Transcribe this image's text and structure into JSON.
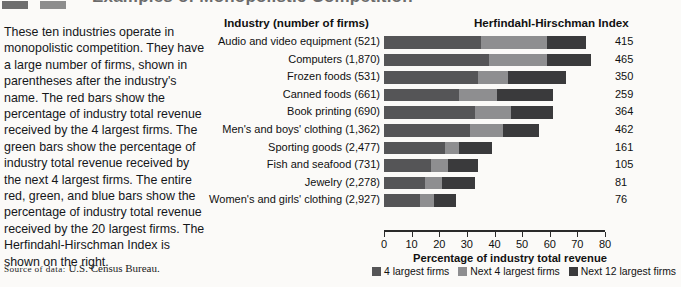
{
  "figure": {
    "cut_title": "Examples of Monopolistic Competition",
    "caption": "These ten industries operate in monopolistic competition. They have a large number of firms, shown in parentheses after the industry's name. The red bars show the percentage of industry total revenue received by the 4 largest firms. The green bars show the percentage of industry total revenue received by the next 4 largest firms. The entire red, green, and blue bars show the percentage of industry total revenue received by the 20 largest firms. The Herfindahl-Hirschman Index is shown on the right.",
    "source_label": "Source of data:",
    "source_value": "U.S. Census Bureau."
  },
  "chart_data": {
    "type": "bar",
    "subtype": "stacked-horizontal",
    "title": "Examples of Monopolistic Competition",
    "column_headers": {
      "industry": "Industry (number of firms)",
      "hhi": "Herfindahl-Hirschman Index"
    },
    "xlabel": "Percentage of industry total revenue",
    "ylabel": "",
    "xlim": [
      0,
      80
    ],
    "xticks": [
      0,
      10,
      20,
      30,
      40,
      50,
      60,
      70,
      80
    ],
    "xticklabels": [
      "0",
      "10",
      "20",
      "30",
      "40",
      "50",
      "60",
      "70",
      "80"
    ],
    "grid": false,
    "legend_position": "bottom-right",
    "categories": [
      "Audio and video equipment  (521)",
      "Computers  (1,870)",
      "Frozen foods  (531)",
      "Canned foods  (661)",
      "Book printing  (690)",
      "Men's and boys' clothing  (1,362)",
      "Sporting goods  (2,477)",
      "Fish and seafood  (731)",
      "Jewelry  (2,278)",
      "Women's and girls' clothing  (2,927)"
    ],
    "series": [
      {
        "name": "4 largest firms",
        "color": "#555557",
        "values": [
          35,
          38,
          34,
          27,
          33,
          31,
          22,
          17,
          15,
          13
        ]
      },
      {
        "name": "Next 4 largest firms",
        "color": "#8e8e90",
        "values": [
          24,
          21,
          11,
          14,
          13,
          12,
          5,
          6,
          6,
          5
        ]
      },
      {
        "name": "Next 12 largest firms",
        "color": "#3a3a3c",
        "values": [
          14,
          16,
          21,
          20,
          15,
          13,
          12,
          11,
          12,
          8
        ]
      }
    ],
    "totals_20_largest": [
      73,
      75,
      66,
      61,
      61,
      56,
      39,
      34,
      33,
      26
    ],
    "hhi_label": "Herfindahl-Hirschman Index",
    "hhi_values": [
      415,
      465,
      350,
      259,
      364,
      462,
      161,
      105,
      81,
      76
    ],
    "legend": [
      {
        "label": "4 largest firms",
        "color": "#555557"
      },
      {
        "label": "Next 4 largest firms",
        "color": "#8e8e90"
      },
      {
        "label": "Next 12 largest firms",
        "color": "#3a3a3c"
      }
    ]
  }
}
